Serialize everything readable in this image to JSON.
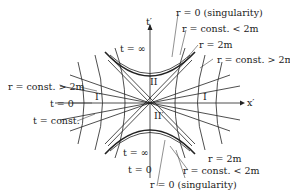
{
  "diagram": {
    "axes": {
      "x": "x′",
      "y": "t′"
    },
    "regions": [
      "I",
      "I′",
      "II",
      "II′"
    ],
    "labels": {
      "top_singularity": "r = 0 (singularity)",
      "top_const_lt": "r = const. < 2m",
      "top_horizon": "r = 2m",
      "top_const_gt": "r = const. > 2m",
      "left_const_gt": "r = const. > 2m",
      "t_inf_top": "t = ∞",
      "t_zero": "t = 0",
      "t_const": "t = const.",
      "t_inf_bottom": "t = ∞",
      "t_bottom": "t = 0",
      "bot_horizon": "r = 2m",
      "bot_const_lt": "r = const. < 2m",
      "bot_singularity": "r = 0 (singularity)"
    },
    "colors": {
      "line": "#222222",
      "background": "#ffffff"
    }
  }
}
